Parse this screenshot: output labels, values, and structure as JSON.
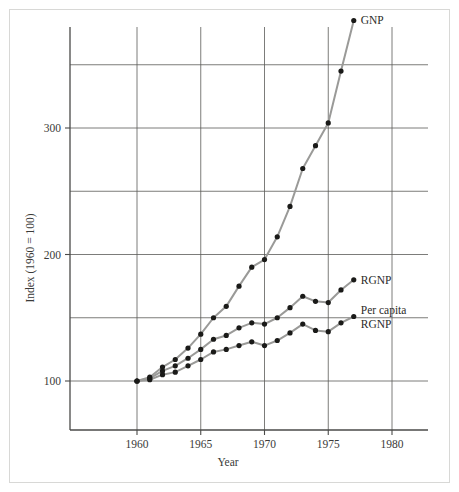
{
  "figure": {
    "background_color": "#ffffff",
    "frame_color": "#d8d8d6",
    "axis_color": "#4a4a48",
    "grid_color": "#5a5a58",
    "line_color": "#9a9a98",
    "marker_color": "#1a1a18"
  },
  "axes": {
    "ylabel": "Index (1960 = 100)",
    "xlabel": "Year",
    "ylim": [
      50,
      400
    ],
    "xlim": [
      1957.5,
      1983.5
    ],
    "y_ticks_labeled": [
      100,
      200,
      300
    ],
    "y_tick_labels": [
      "100",
      "200",
      "300"
    ],
    "y_gridlines": [
      100,
      150,
      200,
      250,
      300,
      350
    ],
    "x_ticks": [
      1960,
      1965,
      1970,
      1975,
      1980
    ],
    "x_tick_labels": [
      "1960",
      "1965",
      "1970",
      "1975",
      "1980"
    ],
    "x_gridlines": [
      1960,
      1965,
      1970,
      1975,
      1980
    ],
    "grid": true
  },
  "chart_data": {
    "type": "line",
    "title": "",
    "subtitle": "",
    "xlabel": "Year",
    "ylabel": "Index (1960 = 100)",
    "xlim": [
      1957.5,
      1983.5
    ],
    "ylim": [
      50,
      400
    ],
    "grid": true,
    "legend_position": "right-inline-end-of-line",
    "x": [
      1960,
      1961,
      1962,
      1963,
      1964,
      1965,
      1966,
      1967,
      1968,
      1969,
      1970,
      1971,
      1972,
      1973,
      1974,
      1975,
      1976,
      1977
    ],
    "series": [
      {
        "name": "GNP",
        "label": "GNP",
        "values": [
          100,
          103,
          111,
          117,
          126,
          137,
          150,
          159,
          175,
          190,
          196,
          214,
          238,
          268,
          286,
          304,
          345,
          385
        ]
      },
      {
        "name": "RGNP",
        "label": "RGNP",
        "values": [
          100,
          102,
          108,
          112,
          118,
          125,
          133,
          136,
          142,
          146,
          145,
          150,
          158,
          167,
          163,
          162,
          172,
          180
        ]
      },
      {
        "name": "Per capita RGNP",
        "label": "Per capita RGNP",
        "label_line1": "Per capita",
        "label_line2": "RGNP",
        "values": [
          100,
          101,
          105,
          107,
          112,
          117,
          123,
          125,
          128,
          131,
          128,
          132,
          138,
          145,
          140,
          139,
          146,
          151
        ]
      }
    ]
  }
}
